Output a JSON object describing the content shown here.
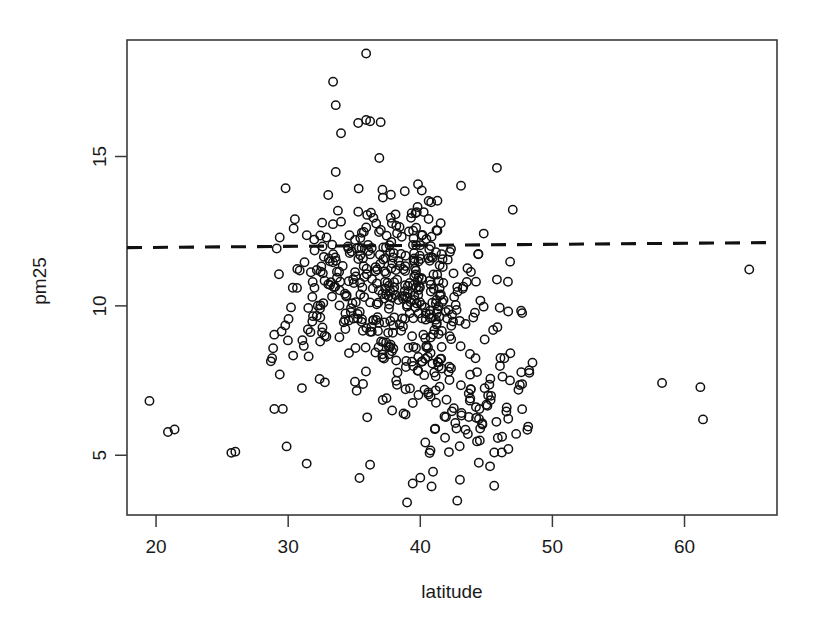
{
  "figure": {
    "background_color": "#ffffff",
    "foreground_color": "#111111",
    "plot_box": {
      "left": 127,
      "top": 40,
      "right": 777,
      "bottom": 515
    }
  },
  "chart_data": {
    "type": "scatter",
    "title": "",
    "subtitle": "",
    "xlabel": "latitude",
    "ylabel": "pm25",
    "xlim": [
      17.8,
      67.0
    ],
    "ylim": [
      3.0,
      18.9
    ],
    "xticks": [
      20,
      30,
      40,
      50,
      60
    ],
    "xtick_labels": [
      "20",
      "30",
      "40",
      "50",
      "60"
    ],
    "yticks": [
      5,
      10,
      15
    ],
    "ytick_labels": [
      "5",
      "10",
      "15"
    ],
    "grid": false,
    "legend": null,
    "legend_position": "none",
    "marker": {
      "symbol": "open-circle",
      "pch": 1,
      "radius_px": 4.2,
      "stroke_color": "#111111",
      "fill": "none",
      "stroke_width": 1.5
    },
    "annotations": [
      {
        "name": "pm25-standard-threshold",
        "kind": "horizontal-dashed-line",
        "y": 12.0,
        "y_left": 11.95,
        "y_right": 12.12,
        "style": "dashed",
        "color": "#111111",
        "label": ""
      }
    ],
    "n_points": 576,
    "x_label_name": "latitude",
    "y_label_name": "pm25",
    "point_distribution_note": "dense cluster between latitude 30-48 and pm25 4-14, sparse outliers at far left (Hawaii ~19-22) and far right (Alaska ~58-65)",
    "outlier_points": [
      [
        19.5,
        6.82
      ],
      [
        20.9,
        5.78
      ],
      [
        21.4,
        5.86
      ],
      [
        25.7,
        5.08
      ],
      [
        58.3,
        7.42
      ],
      [
        61.2,
        7.28
      ],
      [
        61.4,
        6.2
      ],
      [
        64.9,
        11.22
      ],
      [
        35.9,
        18.45
      ],
      [
        33.4,
        17.5
      ],
      [
        33.6,
        16.72
      ],
      [
        35.3,
        16.12
      ],
      [
        35.9,
        16.22
      ],
      [
        36.2,
        16.18
      ],
      [
        37.0,
        16.15
      ],
      [
        34.0,
        15.78
      ],
      [
        36.9,
        14.95
      ],
      [
        33.6,
        14.48
      ],
      [
        45.8,
        14.62
      ],
      [
        47.0,
        13.22
      ],
      [
        34.0,
        12.82
      ],
      [
        44.8,
        12.42
      ],
      [
        46.8,
        11.48
      ],
      [
        45.8,
        10.88
      ],
      [
        39.0,
        3.42
      ],
      [
        42.8,
        3.48
      ],
      [
        43.0,
        4.18
      ],
      [
        35.4,
        4.24
      ],
      [
        40.0,
        4.25
      ],
      [
        36.2,
        4.68
      ],
      [
        31.4,
        4.72
      ],
      [
        26.0,
        5.12
      ]
    ],
    "cluster_centers": [
      {
        "x": 34.2,
        "y": 10.8,
        "weight": 0.22,
        "sx": 1.9,
        "sy": 1.25
      },
      {
        "x": 39.6,
        "y": 11.4,
        "weight": 0.2,
        "sx": 1.8,
        "sy": 1.4
      },
      {
        "x": 41.4,
        "y": 9.4,
        "weight": 0.2,
        "sx": 2.3,
        "sy": 1.4
      },
      {
        "x": 37.2,
        "y": 9.7,
        "weight": 0.15,
        "sx": 2.6,
        "sy": 1.5
      },
      {
        "x": 43.6,
        "y": 7.0,
        "weight": 0.12,
        "sx": 2.6,
        "sy": 1.4
      },
      {
        "x": 30.6,
        "y": 9.2,
        "weight": 0.06,
        "sx": 2.2,
        "sy": 1.7
      },
      {
        "x": 44.8,
        "y": 6.2,
        "weight": 0.05,
        "sx": 2.2,
        "sy": 1.1
      }
    ]
  },
  "axes": {
    "x_axis": {
      "name": "x-axis",
      "title": "latitude",
      "ticks": [
        {
          "value": 20,
          "label": "20"
        },
        {
          "value": 30,
          "label": "30"
        },
        {
          "value": 40,
          "label": "40"
        },
        {
          "value": 50,
          "label": "50"
        },
        {
          "value": 60,
          "label": "60"
        }
      ]
    },
    "y_axis": {
      "name": "y-axis",
      "title": "pm25",
      "rotated_labels": true,
      "ticks": [
        {
          "value": 5,
          "label": "5"
        },
        {
          "value": 10,
          "label": "10"
        },
        {
          "value": 15,
          "label": "15"
        }
      ]
    }
  }
}
